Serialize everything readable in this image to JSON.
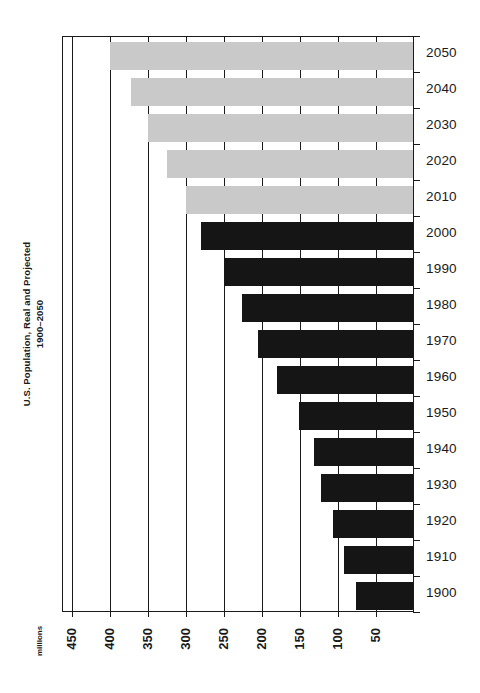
{
  "chart_data": {
    "type": "bar",
    "orientation": "horizontal",
    "title": "U.S. Population, Real and Projected",
    "subtitle": "1900–2050",
    "units_label": "millions",
    "xlabel": "",
    "ylabel": "",
    "grid": true,
    "legend": "none",
    "x_axis": {
      "reversed": true,
      "ticks": [
        450,
        400,
        350,
        300,
        250,
        200,
        150,
        100,
        50
      ],
      "tick_labels": [
        "450",
        "400",
        "350",
        "300",
        "250",
        "200",
        "150",
        "100",
        "50"
      ],
      "min": 0,
      "max": 462
    },
    "categories": [
      "2050",
      "2040",
      "2030",
      "2020",
      "2010",
      "2000",
      "1990",
      "1980",
      "1970",
      "1960",
      "1950",
      "1940",
      "1930",
      "1920",
      "1910",
      "1900"
    ],
    "values": [
      400,
      372,
      350,
      325,
      300,
      281,
      250,
      227,
      205,
      180,
      152,
      132,
      123,
      106,
      92,
      76
    ],
    "series": [
      {
        "name": "Projected",
        "color": "#c9c9c9",
        "points": [
          {
            "category": "2050",
            "value": 400
          },
          {
            "category": "2040",
            "value": 372
          },
          {
            "category": "2030",
            "value": 350
          },
          {
            "category": "2020",
            "value": 325
          },
          {
            "category": "2010",
            "value": 300
          }
        ]
      },
      {
        "name": "Real",
        "color": "#151515",
        "points": [
          {
            "category": "2000",
            "value": 281
          },
          {
            "category": "1990",
            "value": 250
          },
          {
            "category": "1980",
            "value": 227
          },
          {
            "category": "1970",
            "value": 205
          },
          {
            "category": "1960",
            "value": 180
          },
          {
            "category": "1950",
            "value": 152
          },
          {
            "category": "1940",
            "value": 132
          },
          {
            "category": "1930",
            "value": 123
          },
          {
            "category": "1920",
            "value": 106
          },
          {
            "category": "1910",
            "value": 92
          },
          {
            "category": "1900",
            "value": 76
          }
        ]
      }
    ],
    "bars": [
      {
        "category": "2050",
        "value": 400,
        "kind": "projected"
      },
      {
        "category": "2040",
        "value": 372,
        "kind": "projected"
      },
      {
        "category": "2030",
        "value": 350,
        "kind": "projected"
      },
      {
        "category": "2020",
        "value": 325,
        "kind": "projected"
      },
      {
        "category": "2010",
        "value": 300,
        "kind": "projected"
      },
      {
        "category": "2000",
        "value": 281,
        "kind": "real"
      },
      {
        "category": "1990",
        "value": 250,
        "kind": "real"
      },
      {
        "category": "1980",
        "value": 227,
        "kind": "real"
      },
      {
        "category": "1970",
        "value": 205,
        "kind": "real"
      },
      {
        "category": "1960",
        "value": 180,
        "kind": "real"
      },
      {
        "category": "1950",
        "value": 152,
        "kind": "real"
      },
      {
        "category": "1940",
        "value": 132,
        "kind": "real"
      },
      {
        "category": "1930",
        "value": 123,
        "kind": "real"
      },
      {
        "category": "1920",
        "value": 106,
        "kind": "real"
      },
      {
        "category": "1910",
        "value": 92,
        "kind": "real"
      },
      {
        "category": "1900",
        "value": 76,
        "kind": "real"
      }
    ],
    "colors": {
      "real": "#151515",
      "projected": "#c9c9c9",
      "axis": "#1a1a1a",
      "background": "#ffffff"
    }
  }
}
